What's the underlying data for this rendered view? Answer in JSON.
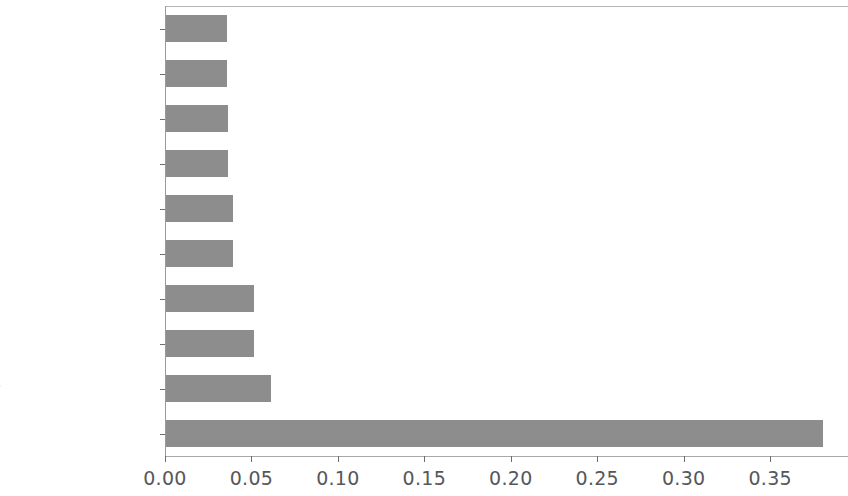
{
  "chart_data": {
    "type": "bar",
    "orientation": "horizontal",
    "title": "",
    "xlabel": "",
    "ylabel": "",
    "categories": [
      "talk_time",
      "sc_w",
      "sc_h",
      "pc",
      "int_memory",
      "mobile_wt",
      "px_height",
      "px_width",
      "battery_power",
      "ram"
    ],
    "values": [
      0.035,
      0.035,
      0.036,
      0.036,
      0.039,
      0.039,
      0.051,
      0.051,
      0.061,
      0.38
    ],
    "xlim": [
      0.0,
      0.395
    ],
    "xticks": [
      0.0,
      0.05,
      0.1,
      0.15,
      0.2,
      0.25,
      0.3,
      0.35
    ],
    "xticklabels": [
      "0.00",
      "0.05",
      "0.10",
      "0.15",
      "0.20",
      "0.25",
      "0.30",
      "0.35"
    ],
    "grid": false,
    "legend": null,
    "bar_color": "#8d8d8d",
    "tick_label_color": "#56575a",
    "axis_color": "#9a9a9a",
    "background_color": "#ffffff"
  }
}
